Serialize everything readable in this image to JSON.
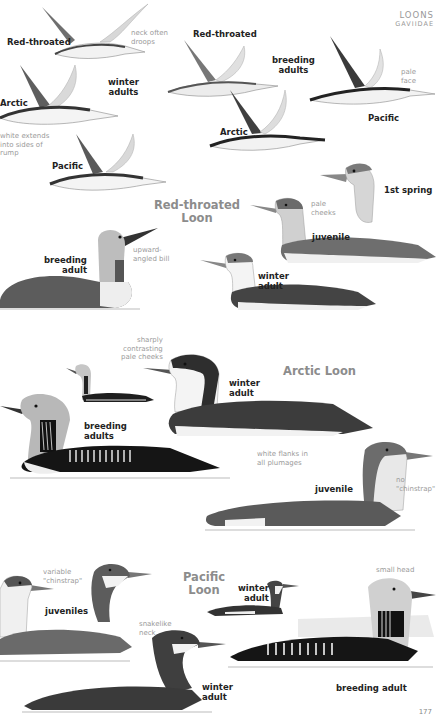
{
  "header": {
    "family": "LOONS",
    "latin": "GAVIIDAE"
  },
  "page_number": "177",
  "flight": {
    "winter_group_label": "winter\nadults",
    "breeding_group_label": "breeding\nadults",
    "winter": [
      {
        "species": "Red-throated",
        "note": "neck often\ndroops"
      },
      {
        "species": "Arctic",
        "note": "white extends\ninto sides of\nrump"
      },
      {
        "species": "Pacific"
      }
    ],
    "breeding": [
      {
        "species": "Red-throated"
      },
      {
        "species": "Arctic"
      },
      {
        "species": "Pacific",
        "note": "pale\nface"
      }
    ]
  },
  "sections": [
    {
      "title": "Red-throated\nLoon",
      "plates": [
        {
          "label": "breeding\nadult",
          "note": "upward-\nangled bill"
        },
        {
          "label": "1st spring"
        },
        {
          "label": "juvenile",
          "note": "pale\ncheeks"
        },
        {
          "label": "winter\nadult"
        }
      ]
    },
    {
      "title": "Arctic Loon",
      "plates": [
        {
          "label": "breeding\nadults"
        },
        {
          "label": "winter\nadult",
          "note": "sharply\ncontrasting\npale cheeks"
        },
        {
          "label": "juvenile",
          "note": "no\n\"chinstrap\""
        }
      ],
      "extra_note": "white flanks in\nall plumages"
    },
    {
      "title": "Pacific\nLoon",
      "plates": [
        {
          "label": "juveniles",
          "note": "variable\n\"chinstrap\""
        },
        {
          "label": "winter\nadult"
        },
        {
          "label": "winter\nadult",
          "note": "snakelike\nneck"
        },
        {
          "label": "breeding adult",
          "note": "small head"
        }
      ]
    }
  ]
}
